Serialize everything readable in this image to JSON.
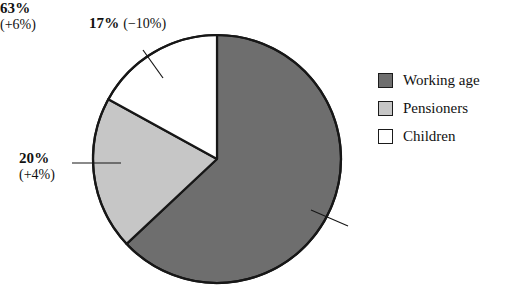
{
  "chart_data": {
    "type": "pie",
    "title": "",
    "subtitle": "",
    "xlabel": "",
    "ylabel": "",
    "legend_position": "right",
    "grid": false,
    "start_angle_deg": 0,
    "direction": "clockwise",
    "categories": [
      "Working age",
      "Pensioners",
      "Children"
    ],
    "values": [
      63,
      20,
      17
    ],
    "value_unit": "%",
    "deltas": [
      6,
      4,
      -10
    ],
    "delta_unit": "%",
    "colors": [
      "#6e6e6e",
      "#c6c6c6",
      "#ffffff"
    ],
    "outline_color": "#171717",
    "slices": [
      {
        "name": "Working age",
        "value": 63,
        "value_label": "63%",
        "delta": 6,
        "delta_label": "(+6%)",
        "color": "#6e6e6e"
      },
      {
        "name": "Pensioners",
        "value": 20,
        "value_label": "20%",
        "delta": 4,
        "delta_label": "(+4%)",
        "color": "#c6c6c6"
      },
      {
        "name": "Children",
        "value": 17,
        "value_label": "17%",
        "delta": -10,
        "delta_label": "(−10%)",
        "color": "#ffffff"
      }
    ]
  },
  "callouts": {
    "children": {
      "pct": "17%",
      "delta": "(−10%)"
    },
    "pensioners": {
      "pct": "20%",
      "delta": "(+4%)"
    },
    "working_age": {
      "pct": "63%",
      "delta": "(+6%)"
    }
  },
  "legend": {
    "items": [
      {
        "label": "Working age",
        "color": "#6e6e6e"
      },
      {
        "label": "Pensioners",
        "color": "#c6c6c6"
      },
      {
        "label": "Children",
        "color": "#ffffff"
      }
    ]
  }
}
